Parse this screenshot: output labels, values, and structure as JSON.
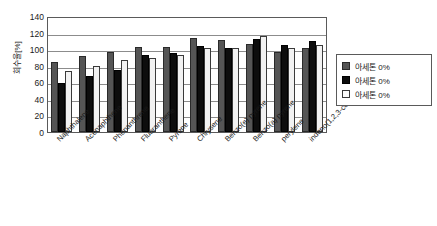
{
  "chart_data": {
    "type": "bar",
    "title": "",
    "xlabel": "",
    "ylabel": "회수율[%]",
    "ylim": [
      0,
      140
    ],
    "ytick_step": 20,
    "yticks": [
      140,
      120,
      100,
      80,
      60,
      40,
      20,
      0
    ],
    "grid": true,
    "legend_position": "right",
    "categories": [
      "Naphthalene",
      "Acenaphthene",
      "Phenanthrene",
      "Fluoranthene",
      "Pyrene",
      "Chrysene",
      "Benzo(e) pyrene",
      "Benzo(a) pyrene",
      "perylene",
      "indeno(1,2,3-cd) pryene"
    ],
    "series": [
      {
        "name": "아세톤 0%",
        "color": "#555555",
        "values": [
          84,
          92,
          96,
          103,
          103,
          113,
          111,
          106,
          96,
          101
        ]
      },
      {
        "name": "아세톤 0%",
        "color": "#0d0d0d",
        "values": [
          59,
          68,
          75,
          93,
          95,
          104,
          101,
          112,
          105,
          110
        ]
      },
      {
        "name": "아세톤 0%",
        "color": "#f2f2f2",
        "values": [
          74,
          80,
          87,
          89,
          93,
          102,
          101,
          116,
          102,
          105
        ]
      }
    ]
  },
  "legend": {
    "items": [
      {
        "label": "아세톤 0%",
        "swatch": "dark-gray"
      },
      {
        "label": "아세톤 0%",
        "swatch": "black"
      },
      {
        "label": "아세톤 0%",
        "swatch": "white"
      }
    ]
  }
}
